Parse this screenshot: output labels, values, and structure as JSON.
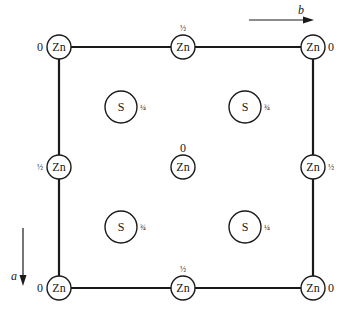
{
  "diagram": {
    "title": "",
    "type": "crystal-structure-projection",
    "colors": {
      "line": "#1a1a1a",
      "background": "#ffffff"
    },
    "axes": {
      "b": {
        "label": "b",
        "direction": "right"
      },
      "a": {
        "label": "a",
        "direction": "down"
      }
    },
    "zn_atoms": [
      {
        "id": "zn-top-left",
        "symbol": "Zn",
        "height": "0",
        "label_pos": "left"
      },
      {
        "id": "zn-top-middle",
        "symbol": "Zn",
        "height": "½",
        "label_pos": "top"
      },
      {
        "id": "zn-top-right",
        "symbol": "Zn",
        "height": "0",
        "label_pos": "right"
      },
      {
        "id": "zn-mid-left",
        "symbol": "Zn",
        "height": "½",
        "label_pos": "left"
      },
      {
        "id": "zn-center",
        "symbol": "Zn",
        "height": "0",
        "label_pos": "top"
      },
      {
        "id": "zn-mid-right",
        "symbol": "Zn",
        "height": "½",
        "label_pos": "right"
      },
      {
        "id": "zn-bottom-left",
        "symbol": "Zn",
        "height": "0",
        "label_pos": "left"
      },
      {
        "id": "zn-bottom-middle",
        "symbol": "Zn",
        "height": "½",
        "label_pos": "top"
      },
      {
        "id": "zn-bottom-right",
        "symbol": "Zn",
        "height": "0",
        "label_pos": "right"
      }
    ],
    "s_atoms": [
      {
        "id": "s-upper-left",
        "symbol": "S",
        "height": "¼"
      },
      {
        "id": "s-upper-right",
        "symbol": "S",
        "height": "¾"
      },
      {
        "id": "s-lower-left",
        "symbol": "S",
        "height": "¾"
      },
      {
        "id": "s-lower-right",
        "symbol": "S",
        "height": "¼"
      }
    ]
  }
}
